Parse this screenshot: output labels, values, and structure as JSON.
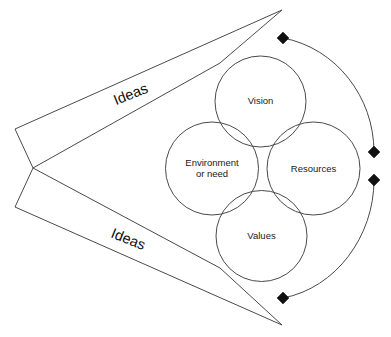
{
  "diagram": {
    "canvas": {
      "width": 391,
      "height": 337,
      "background": "#ffffff"
    },
    "colors": {
      "line": "#4a4a4a",
      "marker": "#111111",
      "text": "#1a1a1a",
      "background": "#ffffff"
    },
    "circles": [
      {
        "id": "vision",
        "label": "Vision",
        "cx": 260.5,
        "cy": 101.5,
        "r": 45.5,
        "label_x": 260.5,
        "label_y": 101.5
      },
      {
        "id": "environment",
        "label_line1": "Environment",
        "label_line2": "or need",
        "cx": 212,
        "cy": 168.5,
        "r": 46.5,
        "label_x": 212,
        "label_y": 163
      },
      {
        "id": "resources",
        "label": "Resources",
        "cx": 313.5,
        "cy": 168.5,
        "r": 46.5,
        "label_x": 313.5,
        "label_y": 169
      },
      {
        "id": "values",
        "label": "Values",
        "cx": 261.5,
        "cy": 236,
        "r": 45.5,
        "label_x": 261.5,
        "label_y": 236
      }
    ],
    "arrows": [
      {
        "id": "upper-ideas-arrow",
        "label": "Ideas",
        "label_x": 131,
        "label_y": 95,
        "label_rotation": -22,
        "outline": "15,129 282,10 220,63 33,168"
      },
      {
        "id": "lower-ideas-arrow",
        "label": "Ideas",
        "label_x": 128,
        "label_y": 240,
        "label_rotation": 22,
        "outline": "33,168 220,268 282,325 15,207"
      }
    ],
    "arcs": [
      {
        "id": "upper-arc",
        "path": "M 283,38 C 336,48 374,97 374,152"
      },
      {
        "id": "lower-arc",
        "path": "M 374,180 C 374,236 336,288 283,298"
      }
    ],
    "markers": [
      {
        "id": "marker-top",
        "x": 283,
        "y": 38,
        "size": 6
      },
      {
        "id": "marker-right-upper",
        "x": 374,
        "y": 152,
        "size": 6
      },
      {
        "id": "marker-right-lower",
        "x": 374,
        "y": 180,
        "size": 6
      },
      {
        "id": "marker-bottom",
        "x": 283,
        "y": 298,
        "size": 6
      }
    ]
  }
}
